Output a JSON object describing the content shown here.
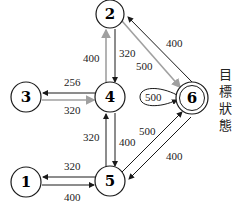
{
  "diagram": {
    "type": "state-transition-graph",
    "goal_label_chars": [
      "目",
      "標",
      "狀",
      "態"
    ],
    "nodes": [
      {
        "id": "1",
        "label": "1"
      },
      {
        "id": "2",
        "label": "2"
      },
      {
        "id": "3",
        "label": "3"
      },
      {
        "id": "4",
        "label": "4"
      },
      {
        "id": "5",
        "label": "5"
      },
      {
        "id": "6",
        "label": "6",
        "goal": true
      }
    ],
    "edges": [
      {
        "from": "4",
        "to": "2",
        "label": "400",
        "highlight": true
      },
      {
        "from": "2",
        "to": "4",
        "label": "320",
        "highlight": false
      },
      {
        "from": "2",
        "to": "6",
        "label": "500",
        "highlight": true
      },
      {
        "from": "6",
        "to": "2",
        "label": "400",
        "highlight": false
      },
      {
        "from": "4",
        "to": "3",
        "label": "256",
        "highlight": false
      },
      {
        "from": "3",
        "to": "4",
        "label": "320",
        "highlight": true
      },
      {
        "from": "6",
        "to": "6",
        "label": "500",
        "highlight": false
      },
      {
        "from": "5",
        "to": "4",
        "label": "320",
        "highlight": false
      },
      {
        "from": "4",
        "to": "5",
        "label": "400",
        "highlight": false
      },
      {
        "from": "5",
        "to": "6",
        "label": "500",
        "highlight": false
      },
      {
        "from": "6",
        "to": "5",
        "label": "400",
        "highlight": false
      },
      {
        "from": "5",
        "to": "1",
        "label": "320",
        "highlight": false
      },
      {
        "from": "1",
        "to": "5",
        "label": "400",
        "highlight": false
      }
    ],
    "colors": {
      "edge": "#1a1a1a",
      "highlight_edge": "#a0a0a0"
    }
  }
}
